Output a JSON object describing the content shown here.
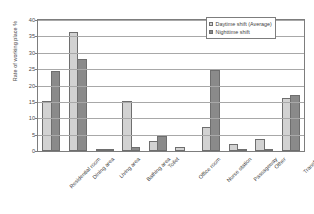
{
  "chart_data": {
    "type": "bar",
    "title": "",
    "xlabel": "",
    "ylabel": "Rate of working place  %",
    "ylim": [
      0,
      40
    ],
    "yticks": [
      0,
      5,
      10,
      15,
      20,
      25,
      30,
      35,
      40
    ],
    "grid": true,
    "legend_position": "top-right",
    "categories": [
      "Residential room",
      "Dining area",
      "Living area",
      "Bathing area",
      "Toilet",
      "Office room",
      "Nurse station",
      "Passageway",
      "Other",
      "Transfer"
    ],
    "series": [
      {
        "name": "Daytime shift (Average)",
        "color": "#d2d2d2",
        "values": [
          15.4,
          36.3,
          0.4,
          15.4,
          3.0,
          1.3,
          7.4,
          2.1,
          3.8,
          16.3
        ]
      },
      {
        "name": "Nighttime shift",
        "color": "#8a8a8a",
        "values": [
          24.5,
          28.0,
          0.1,
          1.3,
          4.6,
          0.0,
          24.6,
          0.3,
          0.7,
          17.2
        ]
      }
    ]
  }
}
